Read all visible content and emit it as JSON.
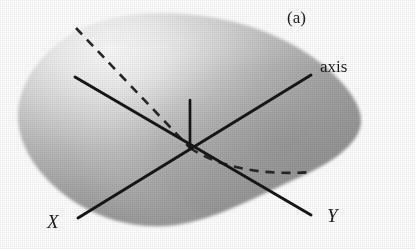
{
  "figure": {
    "panel_label": "(a)",
    "background_color": "#ffffff",
    "ink_color": "#1c1c1c",
    "labels": {
      "panel": "(a)",
      "axis": "axis",
      "x_axis": "X",
      "y_axis": "Y"
    },
    "surface": {
      "name": "ellipsoid-body",
      "fill_highlight_color": "#f2f2f2",
      "fill_mid_color": "#b4b4b4",
      "fill_shadow_color": "#8a8a8a",
      "highlight_center_x": 120,
      "highlight_center_y": 60
    },
    "lines": [
      {
        "name": "x-axis-line",
        "style": "solid",
        "from_x": 75,
        "from_y": 77,
        "to_x": 78,
        "to_y": 218,
        "label": "X"
      },
      {
        "name": "axis-line",
        "style": "solid",
        "from_x": 78,
        "from_y": 218,
        "to_x": 311,
        "to_y": 75,
        "label": "axis"
      },
      {
        "name": "y-axis-line",
        "style": "solid",
        "from_x": 75,
        "from_y": 77,
        "to_x": 311,
        "to_y": 215,
        "label": "Y"
      },
      {
        "name": "vertical-axis-stub",
        "style": "solid",
        "from_x": 190,
        "from_y": 148,
        "to_x": 190,
        "to_y": 100,
        "label": ""
      }
    ],
    "dashed_curves": [
      {
        "name": "dashed-curve-upper-left",
        "style": "dashed",
        "from_x": 76,
        "from_y": 28,
        "to_x": 190,
        "to_y": 148
      },
      {
        "name": "dashed-curve-lower-right",
        "style": "dashed",
        "from_x": 190,
        "from_y": 148,
        "to_x": 312,
        "to_y": 172
      }
    ],
    "intersection_point": {
      "x": 190,
      "y": 148
    }
  }
}
